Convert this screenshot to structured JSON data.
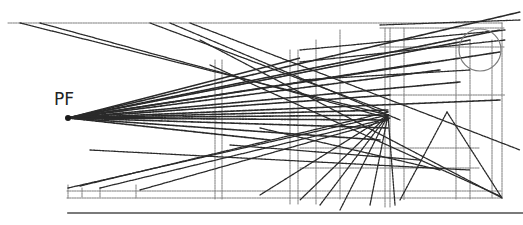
{
  "diagram": {
    "type": "perspective-construction",
    "label": "PF",
    "vanishing_point": {
      "x": 68,
      "y": 118
    },
    "convergence_point": {
      "x": 388,
      "y": 115
    },
    "colors": {
      "ink": "#2a2a2a",
      "light": "#7a7a7a",
      "dot": "#1a1a1a"
    },
    "frame": {
      "top_y": 23,
      "left_x": 8,
      "right_x": 502,
      "bottom_y": 198
    },
    "baseline": {
      "x1": 68,
      "y1": 213,
      "x2": 523,
      "y2": 213
    },
    "circle": {
      "cx": 480,
      "cy": 50,
      "r": 21
    },
    "rays_from_pf": [
      [
        388,
        115
      ],
      [
        520,
        12
      ],
      [
        500,
        30
      ],
      [
        470,
        40
      ],
      [
        440,
        70
      ],
      [
        500,
        100
      ],
      [
        388,
        110
      ],
      [
        388,
        120
      ],
      [
        430,
        62
      ],
      [
        460,
        82
      ],
      [
        390,
        95
      ],
      [
        300,
        58
      ],
      [
        380,
        140
      ],
      [
        388,
        128
      ],
      [
        270,
        140
      ],
      [
        500,
        52
      ]
    ],
    "cross_lines": [
      [
        20,
        23,
        388,
        115
      ],
      [
        40,
        23,
        388,
        118
      ],
      [
        150,
        23,
        388,
        112
      ],
      [
        170,
        23,
        400,
        120
      ],
      [
        190,
        23,
        520,
        150
      ],
      [
        68,
        188,
        388,
        115
      ],
      [
        80,
        186,
        388,
        112
      ],
      [
        100,
        188,
        390,
        118
      ],
      [
        140,
        190,
        388,
        120
      ],
      [
        388,
        115,
        300,
        200
      ],
      [
        388,
        115,
        320,
        205
      ],
      [
        388,
        115,
        340,
        210
      ],
      [
        388,
        115,
        260,
        195
      ],
      [
        388,
        115,
        370,
        205
      ],
      [
        388,
        115,
        395,
        205
      ],
      [
        200,
        40,
        502,
        198
      ],
      [
        210,
        65,
        500,
        196
      ],
      [
        90,
        150,
        470,
        170
      ],
      [
        380,
        25,
        520,
        20
      ],
      [
        300,
        50,
        505,
        30
      ],
      [
        300,
        62,
        505,
        40
      ],
      [
        300,
        80,
        470,
        70
      ],
      [
        447,
        112,
        400,
        200
      ],
      [
        447,
        112,
        502,
        198
      ],
      [
        230,
        145,
        420,
        160
      ],
      [
        260,
        128,
        440,
        170
      ]
    ],
    "verticals": [
      [
        215,
        60,
        215,
        200
      ],
      [
        222,
        60,
        222,
        200
      ],
      [
        290,
        50,
        290,
        205
      ],
      [
        298,
        50,
        298,
        205
      ],
      [
        316,
        40,
        316,
        205
      ],
      [
        340,
        30,
        340,
        200
      ],
      [
        385,
        28,
        385,
        208
      ],
      [
        390,
        28,
        390,
        208
      ],
      [
        404,
        28,
        404,
        200
      ],
      [
        456,
        40,
        456,
        200
      ],
      [
        470,
        40,
        470,
        200
      ],
      [
        492,
        40,
        492,
        198
      ],
      [
        502,
        23,
        502,
        198
      ],
      [
        68,
        185,
        68,
        198
      ],
      [
        82,
        188,
        82,
        198
      ],
      [
        100,
        188,
        100,
        198
      ],
      [
        136,
        185,
        136,
        198
      ]
    ],
    "horizontals": [
      [
        8,
        23,
        502,
        23
      ],
      [
        67,
        191,
        502,
        191
      ],
      [
        67,
        198,
        502,
        198
      ],
      [
        380,
        28,
        505,
        28
      ],
      [
        380,
        47,
        505,
        47
      ],
      [
        300,
        148,
        480,
        148
      ],
      [
        300,
        168,
        480,
        168
      ],
      [
        388,
        95,
        505,
        95
      ]
    ]
  }
}
